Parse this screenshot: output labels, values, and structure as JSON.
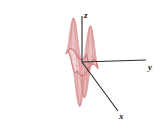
{
  "figure": {
    "kind": "3d-surface-wireframe-plot",
    "title": "",
    "background_color": "#ffffff"
  },
  "axes": {
    "x": {
      "label": "x",
      "name": "x-axis",
      "color": "#2b2b2b"
    },
    "y": {
      "label": "y",
      "name": "y-axis",
      "color": "#2b2b2b"
    },
    "z": {
      "label": "z",
      "name": "z-axis",
      "color": "#2b2b2b"
    }
  },
  "colors": {
    "mesh_light": "#e8b8b8",
    "mesh_mid": "#d98f92",
    "mesh_dark": "#c2686c",
    "rim": "#cf7a7d",
    "axis": "#2b2b2b",
    "background": "#ffffff"
  },
  "chart_data": {
    "type": "line",
    "surface_type": "3d-wireframe-surface",
    "title": "",
    "xlabel": "x",
    "ylabel": "y",
    "zlabel": "z",
    "grid": false,
    "legend": "none",
    "projection": "axonometric",
    "mesh": {
      "u_lines": 34,
      "v_lines": 34
    },
    "domain": {
      "x": [
        -3,
        3
      ],
      "y": [
        -3,
        3
      ]
    },
    "zlim": [
      -1,
      1
    ],
    "function": "z = sin(x) * sin(y)",
    "features": [
      {
        "name": "peak-back-left",
        "x": -1.57,
        "y": 1.57,
        "z": 1.0,
        "screen": [
          52,
          22
        ]
      },
      {
        "name": "peak-back-right",
        "x": 1.57,
        "y": -1.57,
        "z": 1.0,
        "screen": [
          100,
          27
        ]
      },
      {
        "name": "trough-front-left",
        "x": -1.57,
        "y": -1.57,
        "z": -1.0,
        "screen": [
          40,
          98
        ]
      },
      {
        "name": "trough-front-right",
        "x": 1.57,
        "y": 1.57,
        "z": -1.0,
        "screen": [
          112,
          92
        ]
      },
      {
        "name": "saddle-origin",
        "x": 0,
        "y": 0,
        "z": 0,
        "screen": [
          82,
          62
        ]
      }
    ],
    "x": [
      -3.0,
      -2.5,
      -2.0,
      -1.5,
      -1.0,
      -0.5,
      0.0,
      0.5,
      1.0,
      1.5,
      2.0,
      2.5,
      3.0
    ],
    "series": [
      {
        "name": "y = -3.0",
        "values": [
          0.02,
          0.08,
          0.13,
          0.14,
          0.12,
          0.07,
          0.0,
          -0.07,
          -0.12,
          -0.14,
          -0.13,
          -0.08,
          -0.02
        ]
      },
      {
        "name": "y = -1.5",
        "values": [
          0.14,
          0.6,
          0.91,
          1.0,
          0.84,
          0.48,
          0.0,
          -0.48,
          -0.84,
          -1.0,
          -0.91,
          -0.6,
          -0.14
        ]
      },
      {
        "name": "y = 0.0",
        "values": [
          0.0,
          0.0,
          0.0,
          0.0,
          0.0,
          0.0,
          0.0,
          0.0,
          0.0,
          0.0,
          0.0,
          0.0,
          0.0
        ]
      },
      {
        "name": "y = 1.5",
        "values": [
          -0.14,
          -0.6,
          -0.91,
          -1.0,
          -0.84,
          -0.48,
          0.0,
          0.48,
          0.84,
          1.0,
          0.91,
          0.6,
          0.14
        ]
      },
      {
        "name": "y = 3.0",
        "values": [
          -0.02,
          -0.08,
          -0.13,
          -0.14,
          -0.12,
          -0.07,
          0.0,
          0.07,
          0.12,
          0.14,
          0.13,
          0.08,
          0.02
        ]
      }
    ]
  }
}
